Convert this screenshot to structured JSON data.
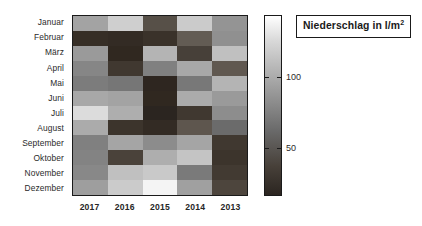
{
  "chart_data": {
    "type": "heatmap",
    "title": "Niederschlag in l/m",
    "title_superscript": "2",
    "title_full": "Niederschlag in l/m2",
    "xlabel": "",
    "ylabel": "",
    "categories_x": [
      "2017",
      "2016",
      "2015",
      "2014",
      "2013"
    ],
    "categories_y": [
      "Januar",
      "Februar",
      "März",
      "April",
      "Mai",
      "Juni",
      "Juli",
      "August",
      "September",
      "Oktober",
      "November",
      "Dezember"
    ],
    "colorbar": {
      "ticks": [
        100,
        50
      ],
      "tick_positions_fraction": [
        0.345,
        0.735
      ],
      "vmin": 18,
      "vmax": 142,
      "low_color": "#2b2520",
      "high_color": "#ffffff",
      "orientation": "vertical"
    },
    "grid": false,
    "legend": "none",
    "values": [
      [
        92,
        118,
        48,
        116,
        82
      ],
      [
        28,
        26,
        30,
        58,
        80
      ],
      [
        86,
        24,
        104,
        38,
        112
      ],
      [
        74,
        34,
        70,
        96,
        56
      ],
      [
        68,
        64,
        22,
        62,
        104
      ],
      [
        96,
        92,
        24,
        100,
        86
      ],
      [
        128,
        98,
        20,
        34,
        78
      ],
      [
        100,
        32,
        26,
        54,
        60
      ],
      [
        70,
        94,
        76,
        94,
        34
      ],
      [
        72,
        40,
        98,
        110,
        32
      ],
      [
        76,
        112,
        120,
        66,
        36
      ],
      [
        88,
        116,
        140,
        90,
        50
      ]
    ],
    "cell_colors": [
      [
        "#a3a3a3",
        "#cfcfcf",
        "#575048",
        "#cbcbcb",
        "#949494"
      ],
      [
        "#362e26",
        "#332b24",
        "#3a322a",
        "#635c54",
        "#909090"
      ],
      [
        "#9a9a9a",
        "#302820",
        "#b4b4b4",
        "#474039",
        "#c0c0c0"
      ],
      [
        "#868686",
        "#403830",
        "#808080",
        "#a8a8a8",
        "#605850"
      ],
      [
        "#7c7c7c",
        "#767676",
        "#2e2620",
        "#787878",
        "#b4b4b4"
      ],
      [
        "#a8a8a8",
        "#a3a3a3",
        "#302820",
        "#ababab",
        "#9a9a9a"
      ],
      [
        "#dcdcdc",
        "#aeaeae",
        "#2b2520",
        "#403830",
        "#8d8d8d"
      ],
      [
        "#ababab",
        "#3c342c",
        "#332b24",
        "#5e564e",
        "#6b6b6b"
      ],
      [
        "#808080",
        "#a5a5a5",
        "#8c8c8c",
        "#a5a5a5",
        "#403830"
      ],
      [
        "#838383",
        "#4a423a",
        "#aeaeae",
        "#c4c4c4",
        "#3c342c"
      ],
      [
        "#888888",
        "#c0c0c0",
        "#c9c9c9",
        "#7a7a7a",
        "#423a32"
      ],
      [
        "#9e9e9e",
        "#cbcbcb",
        "#f4f4f4",
        "#a0a0a0",
        "#4d453d"
      ]
    ]
  },
  "axes": {
    "y_ticks": [
      "Januar",
      "Februar",
      "März",
      "April",
      "Mai",
      "Juni",
      "Juli",
      "August",
      "September",
      "Oktober",
      "November",
      "Dezember"
    ],
    "x_ticks": [
      "2017",
      "2016",
      "2015",
      "2014",
      "2013"
    ]
  },
  "colorbar_labels": {
    "upper": "100",
    "lower": "50"
  },
  "title": {
    "main": "Niederschlag in l/m",
    "sup": "2"
  }
}
